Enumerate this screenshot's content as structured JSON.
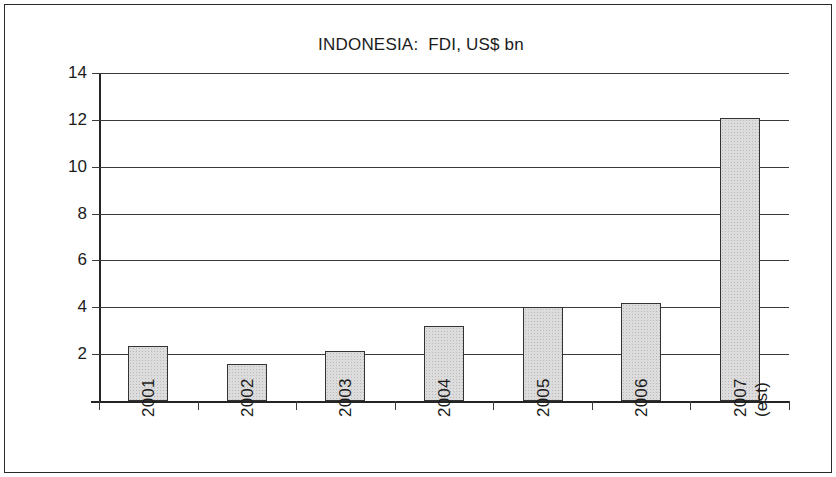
{
  "chart_data": {
    "type": "bar",
    "title": "INDONESIA:  FDI, US$ bn",
    "xlabel": "",
    "ylabel": "",
    "categories": [
      "2001",
      "2002",
      "2003",
      "2004",
      "2005",
      "2006",
      "2007"
    ],
    "category_sublabels": [
      "",
      "",
      "",
      "",
      "",
      "",
      "(est)"
    ],
    "values": [
      2.35,
      1.6,
      2.15,
      3.2,
      4.0,
      4.2,
      12.1
    ],
    "ylim": [
      0,
      14
    ],
    "ytick_labels": [
      "14",
      "12",
      "10",
      "8",
      "6",
      "4",
      "2"
    ],
    "ytick_values": [
      14,
      12,
      10,
      8,
      6,
      4,
      2
    ],
    "grid": true,
    "legend": false,
    "bar_fill_color": "#dcdcdc",
    "bar_border_color": "#333333",
    "axis_color": "#242424",
    "text_color": "#1b1b1b",
    "background_color": "#ffffff"
  }
}
